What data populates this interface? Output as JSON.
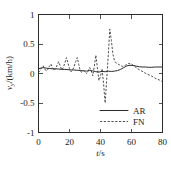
{
  "chart_data": {
    "type": "line",
    "title": "",
    "xlabel": "t/s",
    "xlabel_italic_part": "t",
    "xlabel_rest": "/s",
    "ylabel": "v_y/(km/h)",
    "ylabel_var": "v",
    "ylabel_sub": "y",
    "ylabel_rest": "/(km/h)",
    "xlim": [
      0,
      80
    ],
    "ylim": [
      -1,
      1
    ],
    "xticks": [
      0,
      20,
      40,
      60,
      80
    ],
    "xticklabels": [
      "0",
      "20",
      "40",
      "60",
      "80"
    ],
    "yticks": [
      -1,
      -0.5,
      0,
      0.5,
      1
    ],
    "yticklabels": [
      "-1",
      "-0.5",
      "0",
      "0.5",
      "1"
    ],
    "grid": false,
    "legend_position": "lower-right",
    "series": [
      {
        "name": "AR",
        "style": "solid",
        "color": "#2b2b2b",
        "x": [
          0,
          1.5,
          3,
          5,
          7,
          9,
          11,
          13,
          15,
          17,
          19,
          21,
          23,
          25,
          27,
          29,
          31,
          33,
          35,
          37,
          39,
          41,
          43,
          45,
          47,
          49,
          51,
          53,
          55,
          57,
          59,
          61,
          63,
          65,
          67,
          69,
          71,
          73,
          75,
          77,
          79,
          80
        ],
        "y": [
          0.08,
          0.09,
          0.1,
          0.09,
          0.085,
          0.08,
          0.08,
          0.075,
          0.07,
          0.07,
          0.065,
          0.06,
          0.06,
          0.055,
          0.05,
          0.045,
          0.04,
          0.05,
          0.045,
          0.03,
          0.025,
          0.035,
          0.03,
          0.04,
          0.035,
          0.04,
          0.05,
          0.07,
          0.1,
          0.13,
          0.14,
          0.135,
          0.125,
          0.115,
          0.11,
          0.11,
          0.105,
          0.105,
          0.11,
          0.11,
          0.11,
          0.11
        ]
      },
      {
        "name": "FN",
        "style": "dashed",
        "color": "#4d4d4d",
        "x": [
          0,
          1,
          2,
          3,
          4,
          5,
          6,
          7,
          8,
          9,
          10,
          11,
          12,
          13,
          14,
          15,
          16,
          17,
          18,
          19,
          20,
          21,
          22,
          23,
          24,
          25,
          26,
          27,
          28,
          29,
          30,
          31,
          32,
          33,
          34,
          35,
          36,
          37,
          38,
          39,
          40,
          41,
          42,
          43,
          44,
          45,
          46,
          47,
          48,
          49,
          50,
          52,
          54,
          56,
          58,
          60,
          62,
          64,
          66,
          68,
          70,
          72,
          74,
          76,
          78,
          80
        ],
        "y": [
          0.02,
          0.05,
          0.1,
          0.13,
          0.08,
          0.04,
          0.07,
          0.12,
          0.16,
          0.1,
          0.05,
          0.08,
          0.14,
          0.2,
          0.13,
          0.06,
          0.1,
          0.18,
          0.27,
          0.18,
          0.08,
          0.03,
          0.06,
          0.12,
          0.2,
          0.27,
          0.15,
          0.04,
          0.02,
          0.05,
          0.03,
          0.0,
          0.04,
          0.1,
          0.05,
          -0.04,
          0.12,
          0.31,
          0.1,
          -0.12,
          -0.05,
          0.08,
          -0.18,
          -0.5,
          -0.1,
          0.3,
          0.75,
          0.56,
          0.33,
          0.22,
          0.18,
          0.15,
          0.12,
          0.14,
          0.17,
          0.16,
          0.12,
          0.08,
          0.05,
          0.02,
          -0.01,
          -0.03,
          -0.06,
          -0.09,
          -0.11,
          -0.14
        ]
      }
    ]
  },
  "legend": {
    "entries": [
      {
        "label": "AR",
        "style": "solid"
      },
      {
        "label": "FN",
        "style": "dashed"
      }
    ]
  }
}
